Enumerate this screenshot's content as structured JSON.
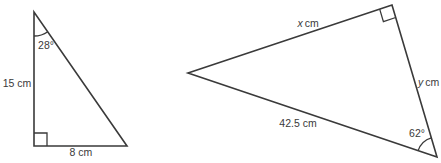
{
  "figure": {
    "ink_color": "#3a3a3a",
    "background_color": "#ffffff",
    "left_triangle": {
      "angle_top_label": "28°",
      "side_left_label": "15 cm",
      "side_bottom_label": "8 cm"
    },
    "right_triangle": {
      "side_top_var": "x",
      "side_top_unit": "cm",
      "side_right_var": "y",
      "side_right_unit": "cm",
      "side_bottom_label": "42.5 cm",
      "angle_bottom_right_label": "62°"
    }
  }
}
